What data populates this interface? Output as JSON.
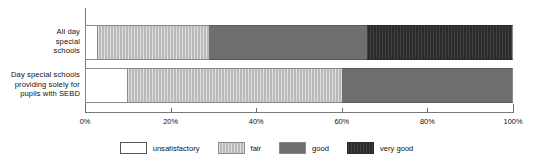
{
  "chart_data": {
    "type": "bar",
    "orientation": "horizontal",
    "stacked": true,
    "title": "",
    "xlabel": "",
    "ylabel": "",
    "xlim": [
      0,
      100
    ],
    "grid": false,
    "legend_position": "bottom",
    "categories": [
      "All day\nspecial\nschools",
      "Day special schools\nproviding solely for\npupils with SEBD"
    ],
    "tick_labels": [
      "0%",
      "20%",
      "40%",
      "60%",
      "80%",
      "100%"
    ],
    "tick_values": [
      0,
      20,
      40,
      60,
      80,
      100
    ],
    "series": [
      {
        "name": "unsatisfactory",
        "color": "#ffffff",
        "values": [
          3,
          10
        ]
      },
      {
        "name": "fair",
        "color": "#b9b9b9",
        "values": [
          26,
          50
        ]
      },
      {
        "name": "good",
        "color": "#6e6e6e",
        "values": [
          37,
          40
        ]
      },
      {
        "name": "very good",
        "color": "#2b2b2b",
        "values": [
          34,
          0
        ]
      }
    ]
  },
  "legend": {
    "items": [
      {
        "label": "unsatisfactory"
      },
      {
        "label": "fair"
      },
      {
        "label": "good"
      },
      {
        "label": "very good"
      }
    ]
  }
}
